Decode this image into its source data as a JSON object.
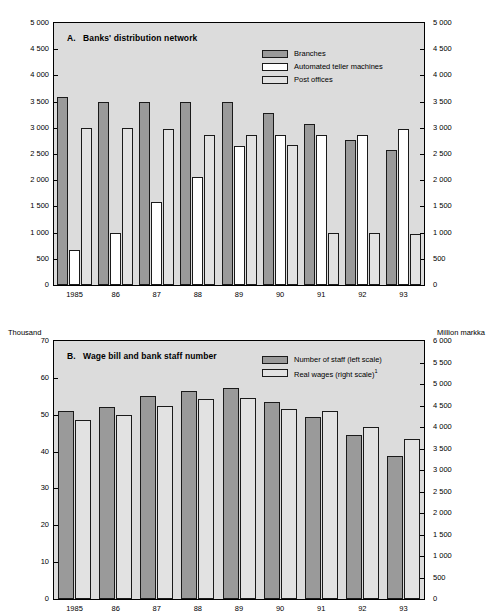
{
  "chart_data": [
    {
      "type": "bar",
      "panel": "A",
      "title": "A.   Banks' distribution network",
      "title_letter": "A.",
      "title_text": "Banks' distribution network",
      "xlabel": "",
      "ylabel": "",
      "ylim": [
        0,
        5000
      ],
      "yticks": [
        0,
        500,
        1000,
        1500,
        2000,
        2500,
        3000,
        3500,
        4000,
        4500,
        5000
      ],
      "ytick_labels": [
        "0",
        "500",
        "1 000",
        "1 500",
        "2 000",
        "2 500",
        "3 000",
        "3 500",
        "4 000",
        "4 500",
        "5 000"
      ],
      "right_axis_same_as_left": true,
      "right_ytick_labels": [
        "0",
        "500",
        "1 000",
        "1 500",
        "2 000",
        "2 500",
        "3 000",
        "3 500",
        "4 000",
        "4 500",
        "5 000"
      ],
      "grid": false,
      "legend_position": "top-right",
      "categories": [
        "1985",
        "86",
        "87",
        "88",
        "89",
        "90",
        "91",
        "92",
        "93"
      ],
      "series": [
        {
          "name": "Branches",
          "color": "#9a9a9a",
          "values": [
            3580,
            3500,
            3500,
            3500,
            3490,
            3290,
            3080,
            2770,
            2570
          ]
        },
        {
          "name": "Automated teller machines",
          "color": "#ffffff",
          "values": [
            670,
            990,
            1580,
            2060,
            2660,
            2860,
            2860,
            2860,
            2970
          ]
        },
        {
          "name": "Post offices",
          "color": "#e2e2e2",
          "values": [
            2990,
            2990,
            2985,
            2870,
            2870,
            2670,
            990,
            985,
            980
          ]
        }
      ]
    },
    {
      "type": "bar",
      "panel": "B",
      "title": "B.   Wage bill and bank staff number",
      "title_letter": "B.",
      "title_text": "Wage bill and bank staff number",
      "left_unit": "Thousand",
      "right_unit": "Million markka",
      "ylim": [
        0,
        70
      ],
      "yticks": [
        0,
        10,
        20,
        30,
        40,
        50,
        60,
        70
      ],
      "ytick_labels": [
        "0",
        "10",
        "20",
        "30",
        "40",
        "50",
        "60",
        "70"
      ],
      "ylim_right": [
        0,
        6000
      ],
      "yticks_right": [
        0,
        500,
        1000,
        1500,
        2000,
        2500,
        3000,
        3500,
        4000,
        4500,
        5000,
        5500,
        6000
      ],
      "ytick_labels_right": [
        "0",
        "500",
        "1 000",
        "1 500",
        "2 000",
        "2 500",
        "3 000",
        "3 500",
        "4 000",
        "4 500",
        "5 000",
        "5 500",
        "6 000"
      ],
      "grid": false,
      "legend_position": "top-right",
      "categories": [
        "1985",
        "86",
        "87",
        "88",
        "89",
        "90",
        "91",
        "92",
        "93"
      ],
      "series": [
        {
          "name": "Number of staff (left scale)",
          "color": "#9a9a9a",
          "scale": "left",
          "values": [
            51.1,
            52.0,
            55.1,
            56.4,
            57.3,
            53.4,
            49.4,
            44.6,
            38.7
          ]
        },
        {
          "name": "Real wages (right scale)",
          "color": "#e2e2e2",
          "scale": "right",
          "footnote": "1",
          "values": [
            4170,
            4270,
            4490,
            4650,
            4670,
            4420,
            4370,
            4010,
            3720
          ]
        }
      ]
    }
  ],
  "panel_a": {
    "title_letter": "A.",
    "title_text": "Banks' distribution network",
    "legend": [
      {
        "label": "Branches",
        "swatch": "dark"
      },
      {
        "label": "Automated teller machines",
        "swatch": "white"
      },
      {
        "label": "Post offices",
        "swatch": "light"
      }
    ]
  },
  "panel_b": {
    "title_letter": "B.",
    "title_text": "Wage bill and bank staff number",
    "left_unit": "Thousand",
    "right_unit": "Million markka",
    "legend": [
      {
        "label": "Number of staff (left scale)",
        "swatch": "dark",
        "footnote": ""
      },
      {
        "label": "Real wages (right scale)",
        "swatch": "light",
        "footnote": "1"
      }
    ]
  }
}
